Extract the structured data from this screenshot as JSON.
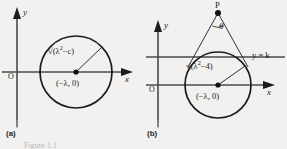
{
  "figure": {
    "caption": "Figure 1.1",
    "panels": [
      {
        "id": "a",
        "caption_label": "(a)",
        "axes": {
          "origin_label": "O",
          "x_label": "x",
          "y_label": "y"
        },
        "circle": {
          "center_label": "(−λ, 0)",
          "radius_label_prefix": "√(λ",
          "radius_label_exp": "2",
          "radius_label_suffix": "−c)"
        }
      },
      {
        "id": "b",
        "caption_label": "(b)",
        "axes": {
          "origin_label": "O",
          "x_label": "x",
          "y_label": "y"
        },
        "circle": {
          "center_label": "(−λ, 0)",
          "radius_label_prefix": "√(λ",
          "radius_label_exp": "2",
          "radius_label_suffix": "−4)"
        },
        "external_point_label": "P",
        "angle_label": "θ",
        "line_label_lhs": "y",
        "line_label_eq": "=",
        "line_label_rhs": "k"
      }
    ]
  },
  "colors": {
    "background": "#f2f1ef",
    "stroke": "#1c1c1c",
    "axis": "#4a4a4a",
    "caption": "#b9b7b4"
  }
}
